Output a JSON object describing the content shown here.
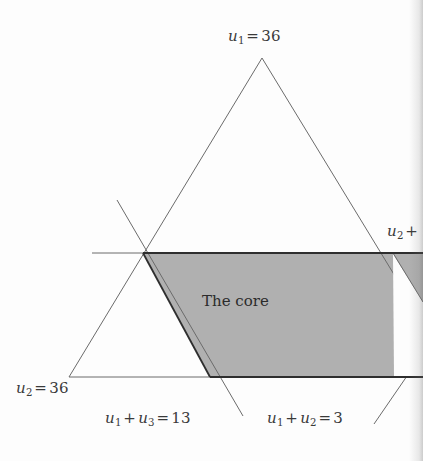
{
  "figure": {
    "kind": "geometry-diagram",
    "title_visible": false,
    "region_label": "The core",
    "colors": {
      "background": "#fdfdfd",
      "shaded_region": "#b0b0b0",
      "thin_line": "#6b6b6b",
      "thick_line": "#2e2e2e",
      "text": "#3a3a3a"
    },
    "labels": {
      "top": {
        "var": "u",
        "sub": "1",
        "op": "=",
        "value": "36",
        "full": "u1 = 36"
      },
      "right_clipped": {
        "var": "u",
        "sub": "2",
        "op": "+",
        "full": "u2 +"
      },
      "left": {
        "var": "u",
        "sub": "2",
        "op": "=",
        "value": "36",
        "full": "u2 = 36"
      },
      "bottom_mid": {
        "var1": "u",
        "sub1": "1",
        "plus": "+",
        "var2": "u",
        "sub2": "3",
        "op": "=",
        "value": "13",
        "full": "u1 + u3 = 13"
      },
      "bottom_right": {
        "var1": "u",
        "sub1": "1",
        "plus": "+",
        "var2": "u",
        "sub2": "2",
        "op": "=",
        "value": "3",
        "full": "u1 + u2 = 3"
      }
    },
    "geometry": {
      "triangle": {
        "apex": [
          262,
          58
        ],
        "bottom_left": [
          69,
          377
        ],
        "bottom_right_extended": [
          423,
          427
        ]
      },
      "horizontal_line": {
        "from": [
          92,
          253
        ],
        "to": [
          423,
          253
        ]
      },
      "slanted_line": {
        "from": [
          117,
          200
        ],
        "to": [
          242,
          414
        ]
      },
      "bottom_edge": {
        "from": [
          69,
          377
        ],
        "to": [
          423,
          377
        ]
      },
      "corner_line": {
        "from": [
          374,
          423
        ],
        "to": [
          406,
          377
        ]
      },
      "core_polygon": [
        [
          143,
          253
        ],
        [
          423,
          253
        ],
        [
          423,
          377
        ],
        [
          210,
          377
        ]
      ]
    }
  }
}
